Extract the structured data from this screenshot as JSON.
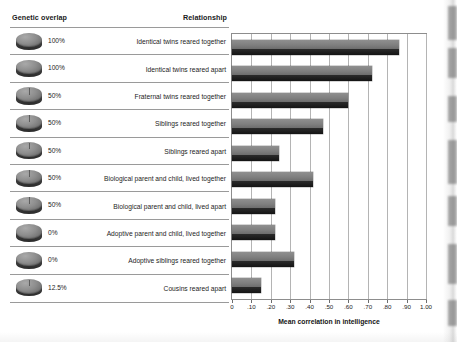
{
  "figure": {
    "headers": {
      "genetic_overlap": "Genetic overlap",
      "relationship": "Relationship"
    },
    "rows": [
      {
        "overlap": "100%",
        "overlap_fraction": 1.0,
        "relationship": "Identical twins reared together",
        "correlation": 0.86
      },
      {
        "overlap": "100%",
        "overlap_fraction": 1.0,
        "relationship": "Identical twins reared apart",
        "correlation": 0.72
      },
      {
        "overlap": "50%",
        "overlap_fraction": 0.5,
        "relationship": "Fraternal twins reared together",
        "correlation": 0.6
      },
      {
        "overlap": "50%",
        "overlap_fraction": 0.5,
        "relationship": "Siblings reared together",
        "correlation": 0.47
      },
      {
        "overlap": "50%",
        "overlap_fraction": 0.5,
        "relationship": "Siblings reared apart",
        "correlation": 0.24
      },
      {
        "overlap": "50%",
        "overlap_fraction": 0.5,
        "relationship": "Biological parent and child, lived together",
        "correlation": 0.42
      },
      {
        "overlap": "50%",
        "overlap_fraction": 0.5,
        "relationship": "Biological parent and child, lived apart",
        "correlation": 0.22
      },
      {
        "overlap": "0%",
        "overlap_fraction": 0.0,
        "relationship": "Adoptive parent and child, lived together",
        "correlation": 0.22
      },
      {
        "overlap": "0%",
        "overlap_fraction": 0.0,
        "relationship": "Adoptive siblings reared together",
        "correlation": 0.32
      },
      {
        "overlap": "12.5%",
        "overlap_fraction": 0.125,
        "relationship": "Cousins reared apart",
        "correlation": 0.15
      }
    ]
  },
  "chart_data": {
    "type": "bar",
    "orientation": "horizontal",
    "title": "",
    "xlabel": "Mean correlation in intelligence",
    "ylabel": "",
    "xlim": [
      0,
      1.0
    ],
    "grid": true,
    "legend": false,
    "xticks": [
      0,
      0.1,
      0.2,
      0.3,
      0.4,
      0.5,
      0.6,
      0.7,
      0.8,
      0.9,
      1.0
    ],
    "xtick_labels": [
      "0",
      ".10",
      ".20",
      ".30",
      ".40",
      ".50",
      ".60",
      ".70",
      ".80",
      ".90",
      "1.00"
    ],
    "categories": [
      "Identical twins reared together",
      "Identical twins reared apart",
      "Fraternal twins reared together",
      "Siblings reared together",
      "Siblings reared apart",
      "Biological parent and child, lived together",
      "Biological parent and child, lived apart",
      "Adoptive parent and child, lived together",
      "Adoptive siblings reared together",
      "Cousins reared apart"
    ],
    "values": [
      0.86,
      0.72,
      0.6,
      0.47,
      0.24,
      0.42,
      0.22,
      0.22,
      0.32,
      0.15
    ],
    "bar_color": "#7a7a7a"
  },
  "colors": {
    "bar_top": "#8f8f8f",
    "bar_bottom": "#141414",
    "gridline": "#b4b4b4",
    "rule": "#9a9a9a",
    "text": "#1d1d1d"
  }
}
